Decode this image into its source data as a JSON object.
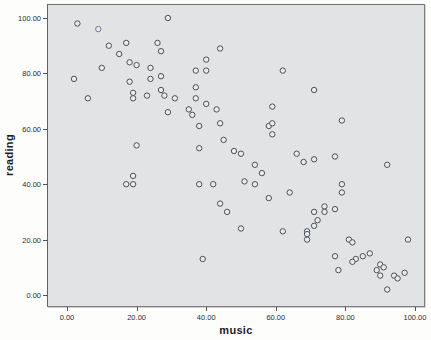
{
  "figure": {
    "plot_bg_color": "#e1e3e4",
    "frame_color": "#7b7d7e",
    "marker_stroke_color": "#4b5156",
    "marker_fill_color": "#e9ebec",
    "highlight_stroke_color": "#6e77a0",
    "tick_color": "#4f5152"
  },
  "chart_data": {
    "type": "scatter",
    "title": "",
    "xlabel": "music",
    "ylabel": "reading",
    "legend": "none",
    "grid": "off",
    "xlim": [
      -5.7,
      102.9
    ],
    "ylim": [
      -4.3,
      105.1
    ],
    "x_tick_values": [
      0,
      20,
      40,
      60,
      80,
      100
    ],
    "y_tick_values": [
      0,
      20,
      40,
      60,
      80,
      100
    ],
    "x_tick_labels": [
      "0.00",
      "20.00",
      "40.00",
      "60.00",
      "80.00",
      "100.00"
    ],
    "y_tick_labels": [
      "0.00",
      "20.00",
      "40.00",
      "60.00",
      "80.00",
      "100.00"
    ],
    "highlighted_point_index": 1,
    "points": [
      [
        3,
        98
      ],
      [
        9,
        96
      ],
      [
        29,
        100
      ],
      [
        17,
        91
      ],
      [
        12,
        90
      ],
      [
        15,
        87
      ],
      [
        26,
        91
      ],
      [
        27,
        88
      ],
      [
        18,
        84
      ],
      [
        20,
        83
      ],
      [
        10,
        82
      ],
      [
        2,
        78
      ],
      [
        18,
        77
      ],
      [
        24,
        82
      ],
      [
        24,
        78
      ],
      [
        27,
        79
      ],
      [
        23,
        72
      ],
      [
        27,
        74
      ],
      [
        28,
        72
      ],
      [
        31,
        71
      ],
      [
        19,
        73
      ],
      [
        19,
        71
      ],
      [
        6,
        71
      ],
      [
        29,
        66
      ],
      [
        20,
        54
      ],
      [
        44,
        89
      ],
      [
        40,
        85
      ],
      [
        40,
        81
      ],
      [
        37,
        81
      ],
      [
        37,
        75
      ],
      [
        62,
        81
      ],
      [
        37,
        71
      ],
      [
        35,
        67
      ],
      [
        36,
        65
      ],
      [
        40,
        69
      ],
      [
        43,
        67
      ],
      [
        38,
        61
      ],
      [
        44,
        62
      ],
      [
        59,
        68
      ],
      [
        58,
        61
      ],
      [
        59,
        62
      ],
      [
        59,
        58
      ],
      [
        45,
        56
      ],
      [
        38,
        53
      ],
      [
        48,
        52
      ],
      [
        50,
        51
      ],
      [
        66,
        51
      ],
      [
        71,
        74
      ],
      [
        79,
        63
      ],
      [
        77,
        50
      ],
      [
        19,
        43
      ],
      [
        17,
        40
      ],
      [
        19,
        40
      ],
      [
        54,
        47
      ],
      [
        56,
        44
      ],
      [
        38,
        40
      ],
      [
        42,
        40
      ],
      [
        51,
        41
      ],
      [
        54,
        40
      ],
      [
        58,
        35
      ],
      [
        64,
        37
      ],
      [
        44,
        33
      ],
      [
        46,
        30
      ],
      [
        50,
        24
      ],
      [
        62,
        23
      ],
      [
        39,
        13
      ],
      [
        68,
        48
      ],
      [
        71,
        49
      ],
      [
        92,
        47
      ],
      [
        79,
        40
      ],
      [
        79,
        37
      ],
      [
        74,
        32
      ],
      [
        74,
        30
      ],
      [
        77,
        31
      ],
      [
        71,
        30
      ],
      [
        72,
        27
      ],
      [
        71,
        25
      ],
      [
        69,
        23
      ],
      [
        69,
        22
      ],
      [
        69,
        20
      ],
      [
        98,
        20
      ],
      [
        81,
        20
      ],
      [
        82,
        19
      ],
      [
        77,
        14
      ],
      [
        83,
        13
      ],
      [
        82,
        12
      ],
      [
        85,
        14
      ],
      [
        87,
        15
      ],
      [
        78,
        9
      ],
      [
        89,
        9
      ],
      [
        90,
        11
      ],
      [
        91,
        10
      ],
      [
        90,
        7
      ],
      [
        94,
        7
      ],
      [
        95,
        6
      ],
      [
        97,
        8
      ],
      [
        92,
        2
      ]
    ]
  }
}
